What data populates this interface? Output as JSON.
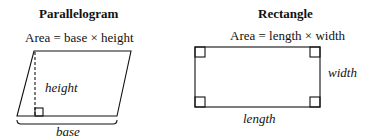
{
  "parallelogram": {
    "title": "Parallelogram",
    "formula": "Area = base × height",
    "height_label": "height",
    "base_label": "base"
  },
  "rectangle": {
    "title": "Rectangle",
    "formula": "Area = length × width",
    "width_label": "width",
    "length_label": "length"
  },
  "colors": {
    "stroke": "#111111",
    "background": "#ffffff"
  }
}
